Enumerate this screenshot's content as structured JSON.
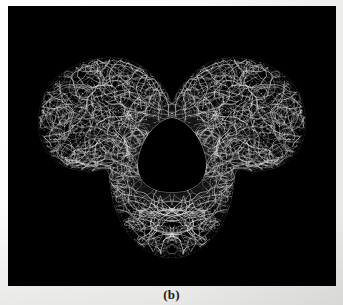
{
  "figure": {
    "caption": "(b)",
    "panel_label": "b",
    "background_color": "#f7f7f5",
    "image_background_color": "#000000",
    "mesh_color": "#d8d8d8",
    "panel": {
      "x": 8,
      "y": 6,
      "width": 328,
      "height": 280
    },
    "render_style": "wireframe-mesh"
  },
  "chart_data": {
    "type": "scatter",
    "title": "",
    "xlabel": "",
    "ylabel": "",
    "grid": false,
    "legend": null,
    "xlim": [
      0,
      328
    ],
    "ylim": [
      0,
      280
    ],
    "regions": [
      {
        "name": "upper-left-lobe",
        "center": [
          108,
          92
        ],
        "rx": 78,
        "ry": 52,
        "rotation": -18,
        "density": 1.0,
        "brightness": 0.8,
        "speckle": 0.9
      },
      {
        "name": "upper-right-lobe",
        "center": [
          220,
          92
        ],
        "rx": 78,
        "ry": 52,
        "rotation": 18,
        "density": 1.0,
        "brightness": 0.8,
        "speckle": 0.9
      },
      {
        "name": "central-body",
        "center": [
          164,
          150
        ],
        "rx": 80,
        "ry": 62,
        "rotation": 0,
        "density": 1.0,
        "brightness": 0.95,
        "speckle": 0.45
      },
      {
        "name": "lower-lobe",
        "center": [
          164,
          205
        ],
        "rx": 66,
        "ry": 58,
        "rotation": 0,
        "density": 1.0,
        "brightness": 0.88,
        "speckle": 0.55
      },
      {
        "name": "central-cavity",
        "center": [
          164,
          150
        ],
        "rx": 34,
        "ry": 36,
        "rotation": 0,
        "density": 0.0,
        "brightness": 0.0,
        "speckle": 0.0
      }
    ],
    "silhouette": [
      [
        30,
        112
      ],
      [
        36,
        88
      ],
      [
        50,
        70
      ],
      [
        70,
        58
      ],
      [
        92,
        52
      ],
      [
        112,
        52
      ],
      [
        130,
        58
      ],
      [
        146,
        70
      ],
      [
        158,
        84
      ],
      [
        164,
        96
      ],
      [
        170,
        84
      ],
      [
        182,
        70
      ],
      [
        198,
        58
      ],
      [
        216,
        52
      ],
      [
        236,
        52
      ],
      [
        258,
        58
      ],
      [
        278,
        70
      ],
      [
        292,
        88
      ],
      [
        298,
        112
      ],
      [
        296,
        132
      ],
      [
        286,
        150
      ],
      [
        268,
        162
      ],
      [
        246,
        166
      ],
      [
        230,
        164
      ],
      [
        226,
        180
      ],
      [
        222,
        200
      ],
      [
        212,
        222
      ],
      [
        196,
        240
      ],
      [
        178,
        250
      ],
      [
        164,
        252
      ],
      [
        150,
        250
      ],
      [
        132,
        240
      ],
      [
        116,
        222
      ],
      [
        106,
        200
      ],
      [
        102,
        180
      ],
      [
        98,
        164
      ],
      [
        82,
        166
      ],
      [
        60,
        162
      ],
      [
        42,
        150
      ],
      [
        32,
        132
      ]
    ],
    "cavity_outline": [
      [
        164,
        112
      ],
      [
        148,
        120
      ],
      [
        136,
        136
      ],
      [
        130,
        156
      ],
      [
        134,
        174
      ],
      [
        148,
        184
      ],
      [
        164,
        186
      ],
      [
        180,
        184
      ],
      [
        194,
        174
      ],
      [
        198,
        156
      ],
      [
        192,
        136
      ],
      [
        180,
        120
      ]
    ],
    "symmetry": {
      "axis": "vertical",
      "x": 164
    },
    "value_range": [
      0,
      255
    ],
    "colormap": "grayscale"
  }
}
